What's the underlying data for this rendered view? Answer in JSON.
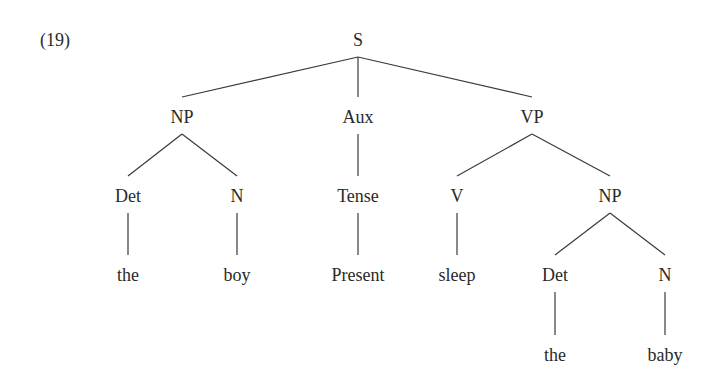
{
  "example_number": "(19)",
  "tree": {
    "nodes": [
      {
        "id": "S",
        "label": "S",
        "x": 358,
        "y": 40
      },
      {
        "id": "NP1",
        "label": "NP",
        "x": 182,
        "y": 117
      },
      {
        "id": "Aux",
        "label": "Aux",
        "x": 358,
        "y": 117
      },
      {
        "id": "VP",
        "label": "VP",
        "x": 532,
        "y": 117
      },
      {
        "id": "Det1",
        "label": "Det",
        "x": 128,
        "y": 196
      },
      {
        "id": "N1",
        "label": "N",
        "x": 237,
        "y": 196
      },
      {
        "id": "Tense",
        "label": "Tense",
        "x": 358,
        "y": 196
      },
      {
        "id": "V",
        "label": "V",
        "x": 457,
        "y": 196
      },
      {
        "id": "NP2",
        "label": "NP",
        "x": 610,
        "y": 196
      },
      {
        "id": "the1",
        "label": "the",
        "x": 128,
        "y": 275
      },
      {
        "id": "boy",
        "label": "boy",
        "x": 237,
        "y": 275
      },
      {
        "id": "Present",
        "label": "Present",
        "x": 358,
        "y": 275
      },
      {
        "id": "sleep",
        "label": "sleep",
        "x": 457,
        "y": 275
      },
      {
        "id": "Det2",
        "label": "Det",
        "x": 555,
        "y": 275
      },
      {
        "id": "N2",
        "label": "N",
        "x": 665,
        "y": 275
      },
      {
        "id": "the2",
        "label": "the",
        "x": 555,
        "y": 355
      },
      {
        "id": "baby",
        "label": "baby",
        "x": 665,
        "y": 355
      }
    ],
    "edges": [
      [
        "S",
        "NP1"
      ],
      [
        "S",
        "Aux"
      ],
      [
        "S",
        "VP"
      ],
      [
        "NP1",
        "Det1"
      ],
      [
        "NP1",
        "N1"
      ],
      [
        "Aux",
        "Tense"
      ],
      [
        "VP",
        "V"
      ],
      [
        "VP",
        "NP2"
      ],
      [
        "Det1",
        "the1"
      ],
      [
        "N1",
        "boy"
      ],
      [
        "Tense",
        "Present"
      ],
      [
        "V",
        "sleep"
      ],
      [
        "NP2",
        "Det2"
      ],
      [
        "NP2",
        "N2"
      ],
      [
        "Det2",
        "the2"
      ],
      [
        "N2",
        "baby"
      ]
    ],
    "line_color": "#3a3a3a"
  }
}
